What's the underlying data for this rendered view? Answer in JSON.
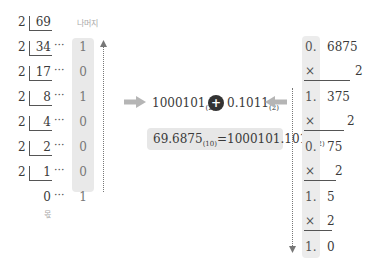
{
  "left_division": {
    "divisor": "2",
    "rows": [
      {
        "quotient": "69",
        "remainder": ""
      },
      {
        "quotient": "34",
        "remainder": "1"
      },
      {
        "quotient": "17",
        "remainder": "0"
      },
      {
        "quotient": "8",
        "remainder": "1"
      },
      {
        "quotient": "4",
        "remainder": "0"
      },
      {
        "quotient": "2",
        "remainder": "0"
      },
      {
        "quotient": "1",
        "remainder": "0"
      }
    ],
    "final": {
      "quotient": "0",
      "remainder": "1"
    },
    "dots": "···",
    "remainder_label": "나머지",
    "quotient_label": "몫"
  },
  "center": {
    "integer_part": "1000101",
    "integer_base": "(2)",
    "plus_symbol": "+",
    "fraction_part": "0.1011",
    "fraction_base": "(2)",
    "result_lhs": "69.6875",
    "result_lhs_base": "(10)",
    "equals": "=",
    "result_rhs": "1000101.1011",
    "result_rhs_base": "(2)"
  },
  "right_multiplication": {
    "rows": [
      {
        "a": "0.",
        "b": "6875",
        "type": "value"
      },
      {
        "a": "×",
        "b": "2",
        "type": "mult"
      },
      {
        "a": "1.",
        "b": "375",
        "type": "value"
      },
      {
        "a": "×",
        "b": "2",
        "type": "mult"
      },
      {
        "a": "0.",
        "b": "75",
        "type": "value"
      },
      {
        "a": "×",
        "b": "2",
        "type": "mult"
      },
      {
        "a": "1.",
        "b": "5",
        "type": "value"
      },
      {
        "a": "×",
        "b": "2",
        "type": "mult"
      },
      {
        "a": "1.",
        "b": "0",
        "type": "value"
      }
    ]
  },
  "colors": {
    "highlight_bg": "#e9e9e9",
    "arrow": "#b5b5b5",
    "plus_circle": "#333333",
    "text": "#3a3a3a"
  }
}
